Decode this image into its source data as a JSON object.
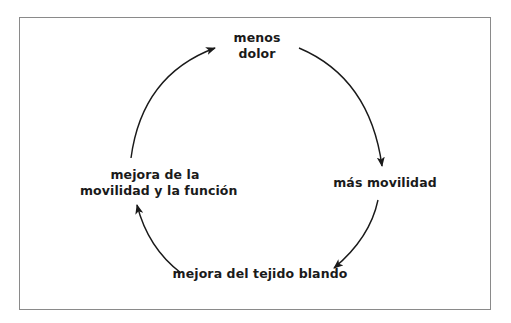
{
  "diagram": {
    "type": "cycle",
    "nodes": [
      {
        "id": "top",
        "line1": "menos",
        "line2": "dolor"
      },
      {
        "id": "right",
        "line1": "más movilidad"
      },
      {
        "id": "bottom",
        "line1": "mejora del tejido blando"
      },
      {
        "id": "left",
        "line1": "mejora de la",
        "line2": "movilidad y la función"
      }
    ],
    "edges": [
      {
        "from": "top",
        "to": "right"
      },
      {
        "from": "right",
        "to": "bottom"
      },
      {
        "from": "bottom",
        "to": "left"
      },
      {
        "from": "left",
        "to": "top"
      }
    ],
    "colors": {
      "frame": "#8a8a8a",
      "text": "#1a1a1a",
      "arrow": "#1a1a1a"
    }
  }
}
